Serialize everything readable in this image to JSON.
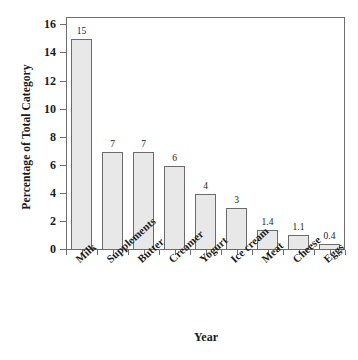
{
  "chart_data": {
    "type": "bar",
    "title": "",
    "xlabel": "Year",
    "ylabel": "Percentage of Total Category",
    "categories": [
      "Milk",
      "Supplements",
      "Butter",
      "Creamer",
      "Yogurt",
      "Ice cream",
      "Meat",
      "Cheese",
      "Eggs"
    ],
    "values": [
      15,
      7,
      7,
      6,
      4,
      3,
      1.4,
      1.1,
      0.4
    ],
    "value_labels": [
      "15",
      "7",
      "7",
      "6",
      "4",
      "3",
      "1.4",
      "1.1",
      "0.4"
    ],
    "ylim": [
      0,
      16.6
    ],
    "yticks": [
      0,
      2,
      4,
      6,
      8,
      10,
      12,
      14,
      16
    ],
    "ytick_labels": [
      "0",
      "2",
      "4",
      "6",
      "8",
      "10",
      "12",
      "14",
      "16"
    ],
    "grid": false,
    "legend": null,
    "bar_fill_color": "#e8e8e8",
    "bar_edge_color": "#6b6b6b",
    "axis_color": "#6e6e6e",
    "background_color": "#ffffff",
    "text_color": "#1a1a1a"
  }
}
